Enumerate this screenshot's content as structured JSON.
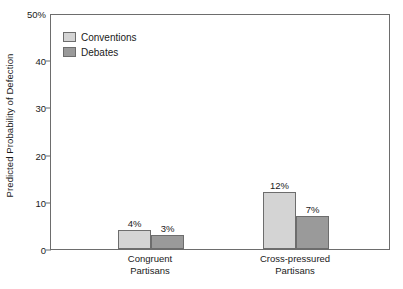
{
  "chart_data": {
    "type": "bar",
    "title": "",
    "xlabel": "",
    "ylabel": "Predicted Probability of Defection",
    "ylim": [
      0,
      50
    ],
    "yticks": [
      {
        "value": 0,
        "label": "0"
      },
      {
        "value": 10,
        "label": "10"
      },
      {
        "value": 20,
        "label": "20"
      },
      {
        "value": 30,
        "label": "30"
      },
      {
        "value": 40,
        "label": "40"
      },
      {
        "value": 50,
        "label": "50%"
      }
    ],
    "grid": false,
    "legend_position": "top-left-inside",
    "categories": [
      "Congruent Partisans",
      "Cross-pressured Partisans"
    ],
    "category_lines": [
      [
        "Congruent",
        "Partisans"
      ],
      [
        "Cross-pressured",
        "Partisans"
      ]
    ],
    "series": [
      {
        "name": "Conventions",
        "color": "#d4d4d4",
        "values": [
          4,
          12
        ],
        "value_labels": [
          "4%",
          "12%"
        ]
      },
      {
        "name": "Debates",
        "color": "#9a9a9a",
        "values": [
          3,
          7
        ],
        "value_labels": [
          "3%",
          "7%"
        ]
      }
    ],
    "colors": {
      "conventions": "#d4d4d4",
      "debates": "#9a9a9a",
      "axis": "#6d6d6d",
      "text": "#1a1a1a",
      "background": "#ffffff"
    }
  }
}
